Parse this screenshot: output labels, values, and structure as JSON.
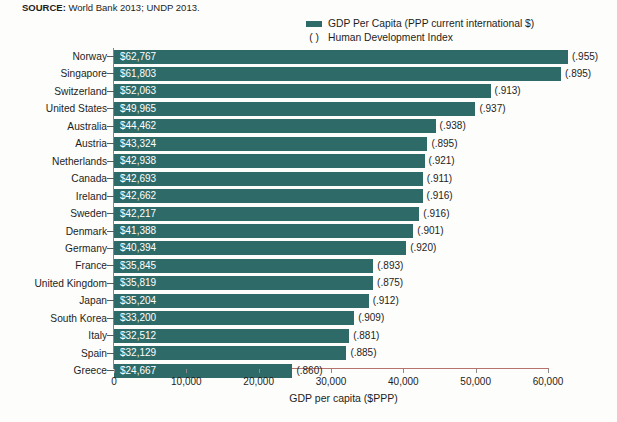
{
  "source": {
    "label": "SOURCE:",
    "text": " World Bank 2013; UNDP 2013."
  },
  "legend": {
    "swatch_color": "#2e6b68",
    "entries": [
      {
        "marker": "swatch",
        "label": "GDP Per Capita (PPP current international $)"
      },
      {
        "marker": "( )",
        "label": "Human Development Index"
      }
    ]
  },
  "axis": {
    "x_title": "GDP per capita ($PPP)",
    "x_ticks": [
      "0",
      "10,000",
      "20,000",
      "30,000",
      "40,000",
      "50,000",
      "60,000"
    ]
  },
  "chart_data": {
    "type": "bar",
    "orientation": "horizontal",
    "title": "",
    "subtitle": "",
    "xlabel": "GDP per capita ($PPP)",
    "ylabel": "",
    "xlim": [
      0,
      60000
    ],
    "xticks": [
      0,
      10000,
      20000,
      30000,
      40000,
      50000,
      60000
    ],
    "grid": false,
    "legend_position": "top-right",
    "bar_color": "#2e6b68",
    "categories": [
      "Norway",
      "Singapore",
      "Switzerland",
      "United States",
      "Australia",
      "Austria",
      "Netherlands",
      "Canada",
      "Ireland",
      "Sweden",
      "Denmark",
      "Germany",
      "France",
      "United Kingdom",
      "Japan",
      "South Korea",
      "Italy",
      "Spain",
      "Greece"
    ],
    "series": [
      {
        "name": "GDP Per Capita (PPP current international $)",
        "values": [
          62767,
          61803,
          52063,
          49965,
          44462,
          43324,
          42938,
          42693,
          42662,
          42217,
          41388,
          40394,
          35845,
          35819,
          35204,
          33200,
          32512,
          32129,
          24667
        ],
        "value_labels": [
          "$62,767",
          "$61,803",
          "$52,063",
          "$49,965",
          "$44,462",
          "$43,324",
          "$42,938",
          "$42,693",
          "$42,662",
          "$42,217",
          "$41,388",
          "$40,394",
          "$35,845",
          "$35,819",
          "$35,204",
          "$33,200",
          "$32,512",
          "$32,129",
          "$24,667"
        ]
      },
      {
        "name": "Human Development Index",
        "values": [
          0.955,
          0.895,
          0.913,
          0.937,
          0.938,
          0.895,
          0.921,
          0.911,
          0.916,
          0.916,
          0.901,
          0.92,
          0.893,
          0.875,
          0.912,
          0.909,
          0.881,
          0.885,
          0.86
        ],
        "value_labels": [
          "(.955)",
          "(.895)",
          "(.913)",
          "(.937)",
          "(.938)",
          "(.895)",
          "(.921)",
          "(.911)",
          "(.916)",
          "(.916)",
          "(.901)",
          "(.920)",
          "(.893)",
          "(.875)",
          "(.912)",
          "(.909)",
          "(.881)",
          "(.885)",
          "(.860)"
        ]
      }
    ]
  }
}
